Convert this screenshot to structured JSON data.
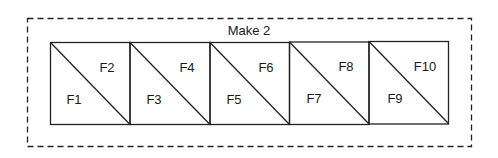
{
  "diagram": {
    "group_label": "Make 2",
    "units": [
      {
        "lower_label": "F1",
        "upper_label": "F2"
      },
      {
        "lower_label": "F3",
        "upper_label": "F4"
      },
      {
        "lower_label": "F5",
        "upper_label": "F6"
      },
      {
        "lower_label": "F7",
        "upper_label": "F8"
      },
      {
        "lower_label": "F9",
        "upper_label": "F10"
      }
    ]
  }
}
